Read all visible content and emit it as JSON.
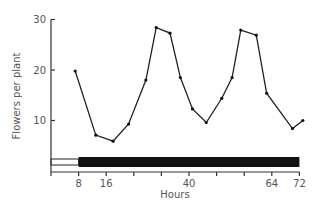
{
  "chart_data": {
    "type": "line",
    "title": "",
    "xlabel": "Hours",
    "ylabel": "Flowers per plant",
    "xlim": [
      0,
      72
    ],
    "ylim": [
      0,
      30
    ],
    "x_ticks": [
      0,
      8,
      16,
      24,
      32,
      40,
      48,
      56,
      64,
      72
    ],
    "x_tick_labels": [
      {
        "value": 8,
        "label": "8"
      },
      {
        "value": 16,
        "label": "16"
      },
      {
        "value": 40,
        "label": "40"
      },
      {
        "value": 64,
        "label": "64"
      },
      {
        "value": 72,
        "label": "72"
      }
    ],
    "y_ticks": [
      10,
      20,
      30
    ],
    "y_tick_labels": [
      "10",
      "20",
      "30"
    ],
    "grid": false,
    "legend": null,
    "series": [
      {
        "name": "Flowers per plant",
        "x": [
          7,
          13,
          18,
          22.5,
          27.5,
          30.5,
          34.5,
          37.5,
          41,
          45,
          49.5,
          52.5,
          55,
          59.5,
          62.5,
          70,
          73
        ],
        "values": [
          19.8,
          7.1,
          5.9,
          9.3,
          18,
          28.4,
          27.3,
          18.5,
          12.3,
          9.6,
          14.4,
          18.5,
          27.9,
          26.9,
          15.4,
          8.4,
          10
        ]
      }
    ],
    "light_dark_bar": {
      "light": {
        "start": 0,
        "end": 8
      },
      "dark": {
        "start": 8,
        "end": 72
      }
    }
  }
}
